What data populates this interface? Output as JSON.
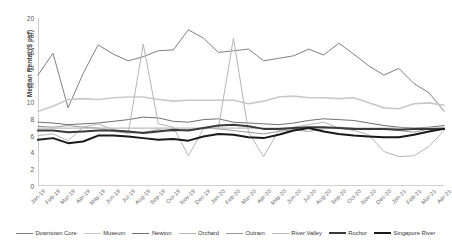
{
  "chart_data": {
    "type": "line",
    "title": "",
    "xlabel": "",
    "ylabel": "Median Rental ($ psf)",
    "ylim": [
      0,
      20
    ],
    "yticks": [
      0,
      2,
      4,
      6,
      8,
      10,
      12,
      14,
      16,
      18,
      20
    ],
    "grid": false,
    "legend_position": "bottom",
    "categories": [
      "Jan-19",
      "Feb-19",
      "Mar-19",
      "Apr-19",
      "May-19",
      "Jun-19",
      "Jul-19",
      "Aug-19",
      "Sep-19",
      "Oct-19",
      "Nov-19",
      "Dec-19",
      "Jan-20",
      "Feb-20",
      "Mar-20",
      "Apr-20",
      "May-20",
      "Jun-20",
      "Jul-20",
      "Aug-20",
      "Sep-20",
      "Oct-20",
      "Nov-20",
      "Dec-20",
      "Jan-21",
      "Feb-21",
      "Mar-21",
      "Apr-21"
    ],
    "series": [
      {
        "name": "Downtown Core",
        "color": "#808080",
        "width": 1.0,
        "values": [
          13.2,
          15.8,
          9.3,
          13.4,
          16.8,
          15.7,
          14.9,
          15.4,
          16.1,
          16.2,
          18.6,
          17.6,
          15.9,
          16.1,
          16.3,
          14.9,
          15.2,
          15.5,
          16.3,
          15.6,
          17.0,
          15.7,
          14.3,
          13.2,
          14.0,
          12.2,
          11.1,
          8.9
        ]
      },
      {
        "name": "Museum",
        "color": "#c9c9c9",
        "width": 1.6,
        "values": [
          8.9,
          9.5,
          10.3,
          10.4,
          10.3,
          10.5,
          10.6,
          10.6,
          10.3,
          10.1,
          10.2,
          10.2,
          10.2,
          10.2,
          9.8,
          10.1,
          10.6,
          10.7,
          10.5,
          10.5,
          10.4,
          10.5,
          9.9,
          9.3,
          9.2,
          9.8,
          9.9,
          9.6
        ]
      },
      {
        "name": "Newton",
        "color": "#707070",
        "width": 1.0,
        "values": [
          7.6,
          7.5,
          7.3,
          7.4,
          7.5,
          7.7,
          7.9,
          8.2,
          8.1,
          7.7,
          7.6,
          7.9,
          8.0,
          7.6,
          7.5,
          7.4,
          7.3,
          7.5,
          7.8,
          8.0,
          7.9,
          7.8,
          7.5,
          7.2,
          7.0,
          6.9,
          7.0,
          7.2
        ]
      },
      {
        "name": "Orchard",
        "color": "#b5b5b5",
        "width": 1.0,
        "values": [
          6.0,
          6.2,
          5.4,
          7.0,
          7.4,
          6.7,
          6.3,
          16.9,
          7.4,
          7.0,
          3.6,
          6.8,
          6.9,
          17.6,
          6.4,
          3.5,
          6.6,
          7.0,
          7.3,
          7.6,
          6.9,
          6.6,
          6.1,
          4.1,
          3.5,
          3.6,
          4.7,
          6.6
        ]
      },
      {
        "name": "Outram",
        "color": "#999999",
        "width": 1.0,
        "values": [
          7.1,
          7.0,
          7.2,
          7.0,
          6.9,
          6.5,
          6.3,
          6.4,
          6.7,
          6.5,
          6.7,
          6.9,
          6.8,
          6.6,
          6.4,
          6.2,
          6.5,
          6.7,
          6.5,
          6.8,
          7.0,
          6.9,
          6.7,
          6.8,
          6.6,
          6.4,
          6.8,
          7.0
        ]
      },
      {
        "name": "River Valley",
        "color": "#bcbcbc",
        "width": 1.2,
        "values": [
          6.9,
          6.9,
          6.9,
          6.9,
          6.9,
          6.9,
          6.9,
          6.9,
          6.9,
          6.9,
          6.9,
          6.9,
          6.9,
          6.9,
          6.9,
          6.9,
          6.9,
          6.9,
          6.9,
          6.9,
          6.9,
          6.9,
          6.9,
          6.9,
          6.9,
          6.9,
          6.9,
          6.9
        ]
      },
      {
        "name": "Rochor",
        "color": "#3a3a3a",
        "width": 2.0,
        "values": [
          6.6,
          6.6,
          6.4,
          6.5,
          6.6,
          6.6,
          6.5,
          6.3,
          6.5,
          6.7,
          6.6,
          6.9,
          7.2,
          7.3,
          7.1,
          6.8,
          6.8,
          6.9,
          7.0,
          7.0,
          6.9,
          6.8,
          6.8,
          6.8,
          6.7,
          6.8,
          6.8,
          6.8
        ]
      },
      {
        "name": "Singapore River",
        "color": "#1a1a1a",
        "width": 2.0,
        "values": [
          5.5,
          5.7,
          5.1,
          5.3,
          6.0,
          6.0,
          5.9,
          5.7,
          5.5,
          5.6,
          5.4,
          5.9,
          6.2,
          6.1,
          5.8,
          5.7,
          6.1,
          6.6,
          6.9,
          6.5,
          6.2,
          6.0,
          5.9,
          5.8,
          5.8,
          6.1,
          6.5,
          6.8
        ]
      }
    ]
  }
}
